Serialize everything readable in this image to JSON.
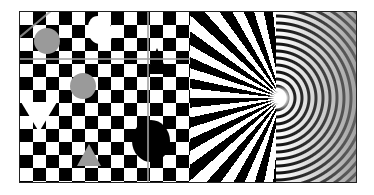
{
  "image": {
    "description": "Resolution test pattern: checkerboard with gray and black overlay shapes, radial starburst, and concentric zone-plate rings",
    "regions": [
      {
        "name": "checkerboard",
        "colors": [
          "#000000",
          "#ffffff"
        ],
        "overlay_shape_color": "#9a9a9a"
      },
      {
        "name": "starburst",
        "colors": [
          "#000000",
          "#ffffff"
        ]
      },
      {
        "name": "zone-plate",
        "colors": [
          "#000000",
          "#ffffff"
        ]
      }
    ],
    "frame_color": "#222222",
    "background": "#ffffff"
  }
}
